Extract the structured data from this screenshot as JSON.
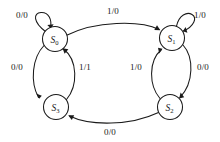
{
  "diagram": {
    "type": "state-transition-diagram",
    "canvas": {
      "width": 220,
      "height": 142
    },
    "colors": {
      "stroke": "#1a1a1a",
      "background": "#ffffff",
      "node_fill": "#ffffff"
    },
    "label_format": "input/output",
    "states": [
      {
        "id": "S0",
        "name": "S",
        "subscript": "0",
        "cx": 55,
        "cy": 39,
        "r": 12.5
      },
      {
        "id": "S1",
        "name": "S",
        "subscript": "1",
        "cx": 172,
        "cy": 38,
        "r": 12.5
      },
      {
        "id": "S2",
        "name": "S",
        "subscript": "2",
        "cx": 170,
        "cy": 107,
        "r": 12.5
      },
      {
        "id": "S3",
        "name": "S",
        "subscript": "3",
        "cx": 56,
        "cy": 107,
        "r": 12.5
      }
    ],
    "transitions": [
      {
        "id": "t-s0-self",
        "from": "S0",
        "to": "S0",
        "input": "0",
        "output": "0",
        "label": "0/0",
        "lx": 22,
        "ly": 15
      },
      {
        "id": "t-s0-s1",
        "from": "S0",
        "to": "S1",
        "input": "1",
        "output": "0",
        "label": "1/0",
        "lx": 113,
        "ly": 11
      },
      {
        "id": "t-s1-self",
        "from": "S1",
        "to": "S1",
        "input": "1",
        "output": "0",
        "label": "1/0",
        "lx": 200,
        "ly": 15
      },
      {
        "id": "t-s0-s3",
        "from": "S0",
        "to": "S3",
        "input": "0",
        "output": "0",
        "label": "0/0",
        "lx": 17,
        "ly": 67
      },
      {
        "id": "t-s3-s0",
        "from": "S3",
        "to": "S0",
        "input": "1",
        "output": "1",
        "label": "1/1",
        "lx": 85,
        "ly": 67
      },
      {
        "id": "t-s2-s1",
        "from": "S2",
        "to": "S1",
        "input": "1",
        "output": "0",
        "label": "1/0",
        "lx": 136,
        "ly": 67
      },
      {
        "id": "t-s1-s2",
        "from": "S1",
        "to": "S2",
        "input": "0",
        "output": "0",
        "label": "0/0",
        "lx": 203,
        "ly": 67
      },
      {
        "id": "t-s2-s3",
        "from": "S2",
        "to": "S3",
        "input": "0",
        "output": "0",
        "label": "0/0",
        "lx": 110,
        "ly": 132
      }
    ]
  }
}
